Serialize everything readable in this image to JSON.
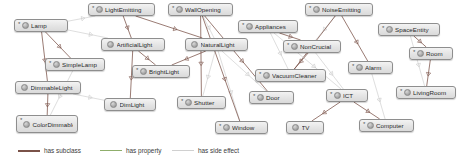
{
  "diagram": {
    "background": "#ffffff",
    "nodes": [
      {
        "id": "lamp",
        "label": "Lamp",
        "star": true,
        "x": 14,
        "y": 19,
        "w": 54,
        "h": 13
      },
      {
        "id": "lightEmitting",
        "label": "LightEmitting",
        "star": true,
        "x": 88,
        "y": 3,
        "w": 67,
        "h": 13
      },
      {
        "id": "wallOpening",
        "label": "WallOpening",
        "star": true,
        "x": 168,
        "y": 3,
        "w": 65,
        "h": 13
      },
      {
        "id": "appliances",
        "label": "Appliances",
        "star": true,
        "x": 238,
        "y": 20,
        "w": 60,
        "h": 13
      },
      {
        "id": "noiseEmitting",
        "label": "NoiseEmitting",
        "star": true,
        "x": 305,
        "y": 3,
        "w": 68,
        "h": 13
      },
      {
        "id": "spaceEntity",
        "label": "SpaceEntity",
        "star": true,
        "x": 378,
        "y": 23,
        "w": 62,
        "h": 13
      },
      {
        "id": "artificialLight",
        "label": "ArtificialLight",
        "star": false,
        "x": 101,
        "y": 38,
        "w": 64,
        "h": 13
      },
      {
        "id": "naturalLight",
        "label": "NaturalLight",
        "star": false,
        "x": 185,
        "y": 38,
        "w": 63,
        "h": 13
      },
      {
        "id": "nonCrucial",
        "label": "NonCrucial",
        "star": true,
        "x": 283,
        "y": 40,
        "w": 58,
        "h": 13
      },
      {
        "id": "room",
        "label": "Room",
        "star": true,
        "x": 409,
        "y": 47,
        "w": 44,
        "h": 13
      },
      {
        "id": "simpleLamp",
        "label": "SimpleLamp",
        "star": true,
        "x": 45,
        "y": 58,
        "w": 60,
        "h": 13
      },
      {
        "id": "brightLight",
        "label": "BrightLight",
        "star": true,
        "x": 132,
        "y": 65,
        "w": 58,
        "h": 13
      },
      {
        "id": "vacuumCleaner",
        "label": "VacuumCleaner",
        "star": true,
        "x": 255,
        "y": 69,
        "w": 71,
        "h": 13
      },
      {
        "id": "alarm",
        "label": "Alarm",
        "star": true,
        "x": 348,
        "y": 61,
        "w": 45,
        "h": 13
      },
      {
        "id": "dimmableLight",
        "label": "DimmableLight",
        "star": false,
        "x": 15,
        "y": 81,
        "w": 66,
        "h": 13
      },
      {
        "id": "dimLight",
        "label": "DimLight",
        "star": false,
        "x": 104,
        "y": 98,
        "w": 52,
        "h": 13
      },
      {
        "id": "shutter",
        "label": "Shutter",
        "star": true,
        "x": 177,
        "y": 96,
        "w": 49,
        "h": 13
      },
      {
        "id": "door",
        "label": "Door",
        "star": true,
        "x": 249,
        "y": 91,
        "w": 45,
        "h": 13
      },
      {
        "id": "ict",
        "label": "ICT",
        "star": true,
        "x": 326,
        "y": 89,
        "w": 42,
        "h": 13
      },
      {
        "id": "livingRoom",
        "label": "LivingRoom",
        "star": true,
        "x": 396,
        "y": 86,
        "w": 60,
        "h": 13
      },
      {
        "id": "colorDimmableLight",
        "label": "ColorDimmableLight",
        "star": true,
        "x": 16,
        "y": 115,
        "w": 62,
        "h": 18
      },
      {
        "id": "window",
        "label": "Window",
        "star": true,
        "x": 215,
        "y": 121,
        "w": 53,
        "h": 13
      },
      {
        "id": "tv",
        "label": "TV",
        "star": false,
        "x": 286,
        "y": 121,
        "w": 38,
        "h": 13
      },
      {
        "id": "computer",
        "label": "Computer",
        "star": true,
        "x": 359,
        "y": 119,
        "w": 55,
        "h": 13
      }
    ],
    "edge_colors": {
      "has_subclass": "#7a5248",
      "has_property": "#7fa05a",
      "has_side_effect": "#c9c9c9"
    },
    "edges": [
      {
        "from": "lightEmitting",
        "to": "artificialLight",
        "type": "has_subclass"
      },
      {
        "from": "lightEmitting",
        "to": "naturalLight",
        "type": "has_subclass"
      },
      {
        "from": "lamp",
        "to": "artificialLight",
        "type": "has_side_effect"
      },
      {
        "from": "lamp",
        "to": "simpleLamp",
        "type": "has_subclass"
      },
      {
        "from": "lamp",
        "to": "dimmableLight",
        "type": "has_subclass"
      },
      {
        "from": "lamp",
        "to": "lightEmitting",
        "type": "has_side_effect"
      },
      {
        "from": "artificialLight",
        "to": "brightLight",
        "type": "has_subclass"
      },
      {
        "from": "artificialLight",
        "to": "dimLight",
        "type": "has_subclass"
      },
      {
        "from": "naturalLight",
        "to": "brightLight",
        "type": "has_subclass"
      },
      {
        "from": "naturalLight",
        "to": "shutter",
        "type": "has_side_effect"
      },
      {
        "from": "naturalLight",
        "to": "window",
        "type": "has_side_effect"
      },
      {
        "from": "naturalLight",
        "to": "door",
        "type": "has_side_effect"
      },
      {
        "from": "wallOpening",
        "to": "naturalLight",
        "type": "has_side_effect"
      },
      {
        "from": "wallOpening",
        "to": "shutter",
        "type": "has_subclass"
      },
      {
        "from": "wallOpening",
        "to": "window",
        "type": "has_subclass"
      },
      {
        "from": "wallOpening",
        "to": "door",
        "type": "has_subclass"
      },
      {
        "from": "dimmableLight",
        "to": "colorDimmableLight",
        "type": "has_subclass"
      },
      {
        "from": "dimmableLight",
        "to": "dimLight",
        "type": "has_side_effect"
      },
      {
        "from": "simpleLamp",
        "to": "colorDimmableLight",
        "type": "has_side_effect"
      },
      {
        "from": "appliances",
        "to": "nonCrucial",
        "type": "has_subclass"
      },
      {
        "from": "appliances",
        "to": "vacuumCleaner",
        "type": "has_side_effect"
      },
      {
        "from": "noiseEmitting",
        "to": "nonCrucial",
        "type": "has_side_effect"
      },
      {
        "from": "noiseEmitting",
        "to": "vacuumCleaner",
        "type": "has_subclass"
      },
      {
        "from": "noiseEmitting",
        "to": "alarm",
        "type": "has_subclass"
      },
      {
        "from": "nonCrucial",
        "to": "vacuumCleaner",
        "type": "has_subclass"
      },
      {
        "from": "nonCrucial",
        "to": "ict",
        "type": "has_side_effect"
      },
      {
        "from": "appliances",
        "to": "ict",
        "type": "has_side_effect"
      },
      {
        "from": "ict",
        "to": "tv",
        "type": "has_subclass"
      },
      {
        "from": "ict",
        "to": "computer",
        "type": "has_subclass"
      },
      {
        "from": "spaceEntity",
        "to": "room",
        "type": "has_subclass"
      },
      {
        "from": "room",
        "to": "livingRoom",
        "type": "has_subclass"
      },
      {
        "from": "spaceEntity",
        "to": "livingRoom",
        "type": "has_side_effect"
      },
      {
        "from": "alarm",
        "to": "computer",
        "type": "has_side_effect"
      }
    ]
  },
  "legend": {
    "items": [
      {
        "id": "has-subclass",
        "label": "has subclass",
        "color": "#7a5248",
        "weight": "thick"
      },
      {
        "id": "has-property",
        "label": "has property",
        "color": "#8fae6b",
        "weight": "thin"
      },
      {
        "id": "has-side-effect",
        "label": "has side effect",
        "color": "#d0d0d0",
        "weight": "thin"
      }
    ],
    "positions": [
      18,
      100,
      172
    ]
  }
}
